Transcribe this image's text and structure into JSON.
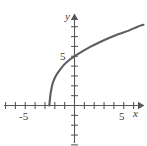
{
  "chart_data": {
    "type": "line",
    "title": "",
    "subtitle": "",
    "xlabel": "x",
    "ylabel": "y",
    "xlim": [
      -7.5,
      6.5
    ],
    "ylim": [
      -4,
      9
    ],
    "grid": false,
    "legend": null,
    "x_ticks": [
      -7,
      -6,
      -5,
      -4,
      -3,
      -2,
      -1,
      1,
      2,
      3,
      4,
      5,
      6
    ],
    "y_ticks": [
      -4,
      -3,
      -2,
      -1,
      1,
      2,
      3,
      4,
      5,
      6,
      7,
      8
    ],
    "x_tick_labels": [
      {
        "value": -5,
        "label": "-5"
      },
      {
        "value": 5,
        "label": "5"
      }
    ],
    "y_tick_labels": [
      {
        "value": 5,
        "label": "5"
      }
    ],
    "tick_interval": 1,
    "axis_arrows": [
      "x-positive",
      "y-positive"
    ],
    "series": [
      {
        "name": "curve",
        "color": "#5d5d60",
        "points": [
          {
            "x": -2.55,
            "y": 0.0
          },
          {
            "x": -2.5,
            "y": 0.6
          },
          {
            "x": -2.4,
            "y": 1.4
          },
          {
            "x": -2.2,
            "y": 2.3
          },
          {
            "x": -1.9,
            "y": 3.0
          },
          {
            "x": -1.5,
            "y": 3.6
          },
          {
            "x": -1.0,
            "y": 4.2
          },
          {
            "x": -0.5,
            "y": 4.65
          },
          {
            "x": 0.0,
            "y": 5.0
          },
          {
            "x": 0.8,
            "y": 5.5
          },
          {
            "x": 1.6,
            "y": 5.95
          },
          {
            "x": 2.5,
            "y": 6.4
          },
          {
            "x": 3.5,
            "y": 6.85
          },
          {
            "x": 4.5,
            "y": 7.25
          },
          {
            "x": 5.5,
            "y": 7.6
          },
          {
            "x": 6.4,
            "y": 8.0
          },
          {
            "x": 7.0,
            "y": 8.2
          }
        ]
      }
    ],
    "annotations": [],
    "axis_color": "#58585a",
    "background_color": "#ffffff"
  },
  "labels": {
    "x_axis": "x",
    "y_axis": "y",
    "x_tick_neg5": "-5",
    "x_tick_pos5": "5",
    "y_tick_5": "5"
  }
}
